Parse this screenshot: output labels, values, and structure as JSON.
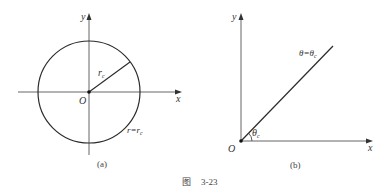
{
  "figure": {
    "caption_prefix": "图",
    "caption_number": "3-23"
  },
  "panel_a": {
    "label": "(a)",
    "y_axis": "y",
    "x_axis": "x",
    "origin": "O",
    "radius_label_main": "r",
    "radius_label_sub": "c",
    "curve_label_main": "r=r",
    "curve_label_sub": "c"
  },
  "panel_b": {
    "label": "(b)",
    "y_axis": "y",
    "x_axis": "x",
    "origin": "O",
    "angle_label_main": "θ",
    "angle_label_sub": "c",
    "line_label_main": "θ=θ",
    "line_label_sub": "c"
  },
  "colors": {
    "stroke": "#2a2a2a",
    "axis": "#555555"
  }
}
